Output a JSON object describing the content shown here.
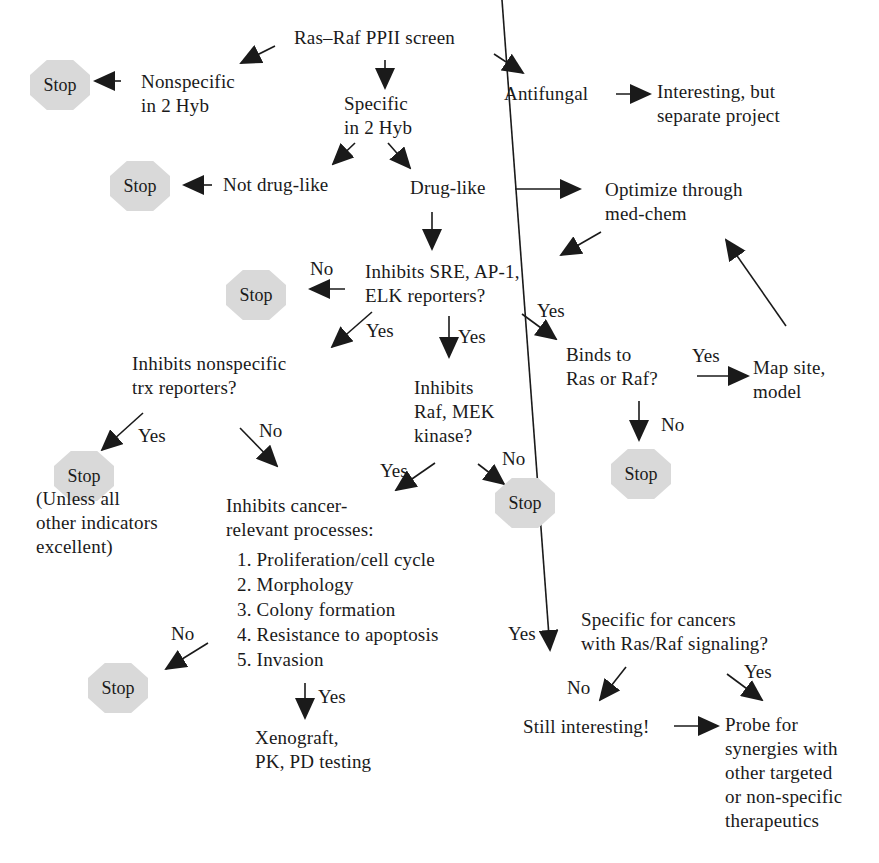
{
  "diagram": {
    "type": "decision-flowchart",
    "root": "Ras–Raf PPII screen",
    "colors": {
      "stop_fill": "#d9d9d9",
      "text": "#1a1a1a",
      "arrow": "#1a1a1a"
    },
    "stop_label": "Stop",
    "nodes": {
      "root": "Ras–Raf PPII screen",
      "nonspecific": [
        "Nonspecific",
        "in 2 Hyb"
      ],
      "specific": [
        "Specific",
        "in 2 Hyb"
      ],
      "antifungal": "Antifungal",
      "separate": [
        "Interesting, but",
        "separate project"
      ],
      "not_drug_like": "Not drug-like",
      "drug_like": "Drug-like",
      "optimize": [
        "Optimize through",
        "med-chem"
      ],
      "inhibits_sre": [
        "Inhibits SRE, AP-1,",
        "ELK reporters?"
      ],
      "inhibits_nonspecific": [
        "Inhibits nonspecific",
        "trx reporters?"
      ],
      "inhibits_raf": [
        "Inhibits",
        "Raf, MEK",
        "kinase?"
      ],
      "binds": [
        "Binds to",
        "Ras or Raf?"
      ],
      "map_site": [
        "Map site,",
        "model"
      ],
      "unless": [
        "(Unless all",
        "other indicators",
        "excellent)"
      ],
      "cancer_processes": [
        "Inhibits cancer-",
        "relevant processes:"
      ],
      "processes": [
        "1. Proliferation/cell cycle",
        "2. Morphology",
        "3. Colony formation",
        "4. Resistance to apoptosis",
        "5. Invasion"
      ],
      "xenograft": [
        "Xenograft,",
        "PK, PD testing"
      ],
      "specific_cancers": [
        "Specific for cancers",
        "with Ras/Raf signaling?"
      ],
      "still_interesting": "Still interesting!",
      "probe": [
        "Probe for",
        "synergies with",
        "other targeted",
        "or non-specific",
        "therapeutics"
      ]
    },
    "edge_labels": {
      "yes": "Yes",
      "no": "No"
    },
    "edges": [
      {
        "from": "root",
        "to": "nonspecific"
      },
      {
        "from": "root",
        "to": "specific"
      },
      {
        "from": "root",
        "to": "antifungal"
      },
      {
        "from": "nonspecific",
        "to": "stop_1"
      },
      {
        "from": "antifungal",
        "to": "separate"
      },
      {
        "from": "specific",
        "to": "not_drug_like"
      },
      {
        "from": "specific",
        "to": "drug_like"
      },
      {
        "from": "not_drug_like",
        "to": "stop_2"
      },
      {
        "from": "drug_like",
        "to": "optimize"
      },
      {
        "from": "drug_like",
        "to": "inhibits_sre"
      },
      {
        "from": "optimize",
        "to": "inhibits_sre"
      },
      {
        "from": "inhibits_sre",
        "to": "stop_3",
        "label": "No"
      },
      {
        "from": "inhibits_sre",
        "to": "inhibits_nonspecific",
        "label": "Yes"
      },
      {
        "from": "inhibits_sre",
        "to": "inhibits_raf",
        "label": "Yes"
      },
      {
        "from": "inhibits_sre",
        "to": "binds",
        "label": "Yes"
      },
      {
        "from": "binds",
        "to": "map_site",
        "label": "Yes"
      },
      {
        "from": "binds",
        "to": "stop_4",
        "label": "No"
      },
      {
        "from": "map_site",
        "to": "optimize"
      },
      {
        "from": "inhibits_nonspecific",
        "to": "stop_5",
        "label": "Yes"
      },
      {
        "from": "inhibits_nonspecific",
        "to": "cancer_processes",
        "label": "No"
      },
      {
        "from": "inhibits_raf",
        "to": "cancer_processes",
        "label": "Yes"
      },
      {
        "from": "inhibits_raf",
        "to": "stop_6",
        "label": "No"
      },
      {
        "from": "cancer_processes",
        "to": "stop_7",
        "label": "No"
      },
      {
        "from": "cancer_processes",
        "to": "xenograft",
        "label": "Yes"
      },
      {
        "from": "cancer_processes",
        "to": "specific_cancers",
        "label": "Yes"
      },
      {
        "from": "specific_cancers",
        "to": "still_interesting",
        "label": "No"
      },
      {
        "from": "specific_cancers",
        "to": "probe",
        "label": "Yes"
      },
      {
        "from": "still_interesting",
        "to": "probe"
      }
    ]
  }
}
